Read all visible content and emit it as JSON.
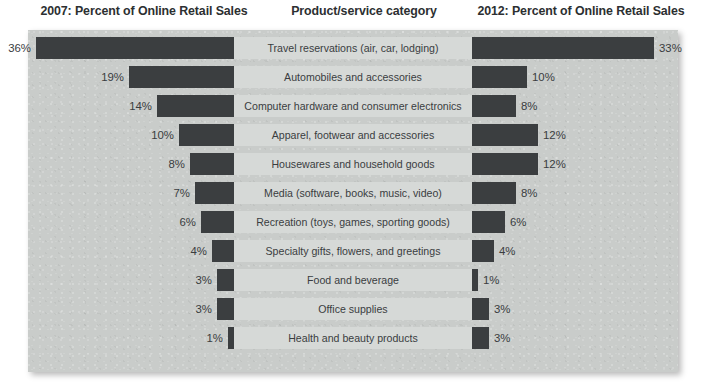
{
  "headers": {
    "left": "2007: Percent of Online Retail Sales",
    "middle": "Product/service category",
    "right": "2012: Percent of Online Retail Sales"
  },
  "chart_data": {
    "type": "bar",
    "subtype": "bilateral-tornado",
    "title": "",
    "categories": [
      "Travel reservations (air, car, lodging)",
      "Automobiles and accessories",
      "Computer hardware and consumer electronics",
      "Apparel, footwear and accessories",
      "Housewares and household goods",
      "Media (software, books, music, video)",
      "Recreation (toys, games, sporting goods)",
      "Specialty gifts, flowers, and greetings",
      "Food and beverage",
      "Office supplies",
      "Health and beauty products"
    ],
    "series": [
      {
        "name": "2007: Percent of Online Retail Sales",
        "side": "left",
        "values": [
          36,
          19,
          14,
          10,
          8,
          7,
          6,
          4,
          3,
          3,
          1
        ],
        "labels": [
          "36%",
          "19%",
          "14%",
          "10%",
          "8%",
          "7%",
          "6%",
          "4%",
          "3%",
          "3%",
          "1%"
        ]
      },
      {
        "name": "2012: Percent of Online Retail Sales",
        "side": "right",
        "values": [
          33,
          10,
          8,
          12,
          12,
          8,
          6,
          4,
          1,
          3,
          3
        ],
        "labels": [
          "33%",
          "10%",
          "8%",
          "12%",
          "12%",
          "8%",
          "6%",
          "4%",
          "1%",
          "3%",
          "3%"
        ]
      }
    ],
    "xlabel": "",
    "ylabel": "Product/service category",
    "unit": "%",
    "grid": false,
    "legend": "none",
    "axis_max": 36,
    "colors": {
      "bar": "#3b3e40",
      "panel": "#c9ccca",
      "label_band": "#d6d9d7",
      "text": "#2c2f31"
    }
  },
  "rows": [
    {
      "category": "Travel reservations (air, car, lodging)",
      "left_label": "36%",
      "right_label": "33%",
      "left_value": 36,
      "right_value": 33
    },
    {
      "category": "Automobiles and accessories",
      "left_label": "19%",
      "right_label": "10%",
      "left_value": 19,
      "right_value": 10
    },
    {
      "category": "Computer hardware and consumer electronics",
      "left_label": "14%",
      "right_label": "8%",
      "left_value": 14,
      "right_value": 8
    },
    {
      "category": "Apparel, footwear and accessories",
      "left_label": "10%",
      "right_label": "12%",
      "left_value": 10,
      "right_value": 12
    },
    {
      "category": "Housewares and household goods",
      "left_label": "8%",
      "right_label": "12%",
      "left_value": 8,
      "right_value": 12
    },
    {
      "category": "Media (software, books, music, video)",
      "left_label": "7%",
      "right_label": "8%",
      "left_value": 7,
      "right_value": 8
    },
    {
      "category": "Recreation (toys, games, sporting goods)",
      "left_label": "6%",
      "right_label": "6%",
      "left_value": 6,
      "right_value": 6
    },
    {
      "category": "Specialty gifts, flowers, and greetings",
      "left_label": "4%",
      "right_label": "4%",
      "left_value": 4,
      "right_value": 4
    },
    {
      "category": "Food and beverage",
      "left_label": "3%",
      "right_label": "1%",
      "left_value": 3,
      "right_value": 1
    },
    {
      "category": "Office supplies",
      "left_label": "3%",
      "right_label": "3%",
      "left_value": 3,
      "right_value": 3
    },
    {
      "category": "Health and beauty products",
      "left_label": "1%",
      "right_label": "3%",
      "left_value": 1,
      "right_value": 3
    }
  ]
}
